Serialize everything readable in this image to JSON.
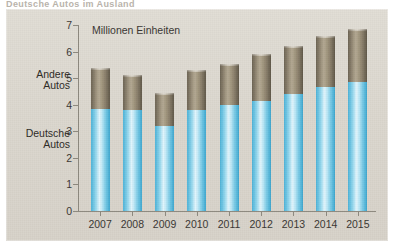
{
  "page": {
    "top_headline_remnant": "Deutsche Autos im Ausland"
  },
  "chart": {
    "axis_title": "Millionen Einheiten",
    "series_labels": {
      "other": "Andere\nAutos",
      "other_line1": "Andere",
      "other_line2": "Autos",
      "german_line1": "Deutsche",
      "german_line2": "Autos"
    },
    "y_ticks": [
      "0",
      "1",
      "2",
      "3",
      "4",
      "5",
      "6",
      "7"
    ],
    "colors": {
      "german": "#79cbe8",
      "other": "#8c8270",
      "background": "#ded9d1",
      "axis": "#8e8a80",
      "text": "#3a3733"
    }
  },
  "chart_data": {
    "type": "bar",
    "subtype": "stacked",
    "title": "Millionen Einheiten",
    "xlabel": "",
    "ylabel": "Millionen Einheiten",
    "ylim": [
      0,
      7
    ],
    "ytick_step": 1,
    "grid": false,
    "legend_position": "left-axis-labels",
    "categories": [
      "2007",
      "2008",
      "2009",
      "2010",
      "2011",
      "2012",
      "2013",
      "2014",
      "2015"
    ],
    "series": [
      {
        "name": "Deutsche Autos",
        "color": "#79cbe8",
        "values": [
          3.85,
          3.8,
          3.2,
          3.8,
          4.0,
          4.15,
          4.4,
          4.65,
          4.85
        ]
      },
      {
        "name": "Andere Autos",
        "color": "#8c8270",
        "values": [
          1.55,
          1.3,
          1.25,
          1.5,
          1.55,
          1.75,
          1.8,
          1.95,
          2.0
        ]
      }
    ],
    "totals": [
      5.4,
      5.1,
      4.45,
      5.3,
      5.55,
      5.9,
      6.2,
      6.6,
      6.85
    ]
  }
}
